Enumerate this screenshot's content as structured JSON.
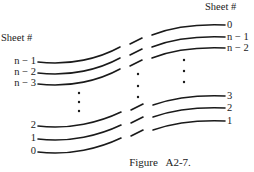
{
  "figure": {
    "caption": "Figure   A2-7.",
    "left_header": "Sheet #",
    "right_header": "Sheet #",
    "left_labels": [
      "n − 1",
      "n − 2",
      "n − 3",
      "2",
      "1",
      "0"
    ],
    "right_labels": [
      "0",
      "n − 1",
      "n − 2",
      "3",
      "2",
      "1"
    ],
    "line_color": "#1a1a1a",
    "ellipsis_glyph": "⋮"
  }
}
